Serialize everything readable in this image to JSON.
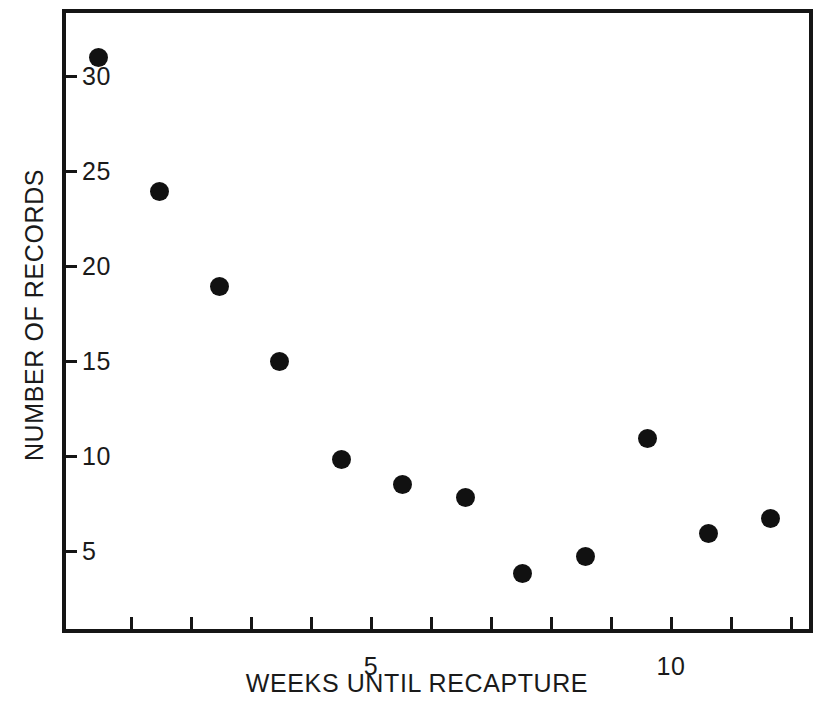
{
  "chart_data": {
    "type": "scatter",
    "title": "",
    "xlabel": "WEEKS UNTIL RECAPTURE",
    "ylabel": "NUMBER OF RECORDS",
    "xlim": [
      0,
      12.5
    ],
    "ylim": [
      2.4,
      33.2
    ],
    "xticks": [
      1,
      2,
      3,
      4,
      5,
      6,
      7,
      8,
      9,
      10,
      11,
      12
    ],
    "xtick_labels": [
      "",
      "",
      "",
      "",
      "5",
      "",
      "",
      "",
      "",
      "10",
      "",
      ""
    ],
    "yticks": [
      5,
      10,
      15,
      20,
      25,
      30
    ],
    "ytick_labels": [
      "5",
      "10",
      "15",
      "20",
      "25",
      "30"
    ],
    "ytick_labels_inside": true,
    "grid": false,
    "legend": null,
    "marker": {
      "shape": "circle",
      "color": "#111111",
      "size_px": 19
    },
    "points": [
      {
        "x": 0.45,
        "y": 31.0
      },
      {
        "x": 1.47,
        "y": 23.9
      },
      {
        "x": 2.48,
        "y": 18.9
      },
      {
        "x": 3.48,
        "y": 15.0
      },
      {
        "x": 4.5,
        "y": 9.8
      },
      {
        "x": 5.53,
        "y": 8.5
      },
      {
        "x": 6.57,
        "y": 7.8
      },
      {
        "x": 7.53,
        "y": 3.8
      },
      {
        "x": 8.57,
        "y": 4.7
      },
      {
        "x": 9.6,
        "y": 10.9
      },
      {
        "x": 10.63,
        "y": 5.9
      },
      {
        "x": 11.65,
        "y": 6.7
      }
    ]
  },
  "axes": {
    "frame_color": "#151515",
    "background": "#ffffff"
  }
}
